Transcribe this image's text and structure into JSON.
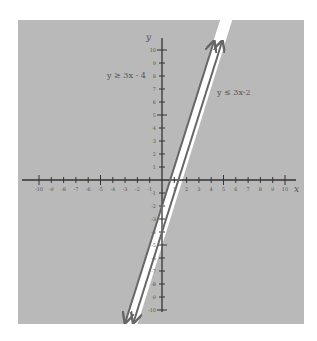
{
  "chart_data": {
    "type": "line",
    "title": "",
    "xlabel": "x",
    "ylabel": "y",
    "xlim": [
      -10,
      10
    ],
    "ylim": [
      -10,
      10
    ],
    "grid": false,
    "x_ticks": [
      -10,
      -9,
      -8,
      -7,
      -6,
      -5,
      -4,
      -3,
      -2,
      -1,
      1,
      2,
      3,
      4,
      5,
      6,
      7,
      8,
      9,
      10
    ],
    "y_ticks": [
      -10,
      -9,
      -8,
      -7,
      -6,
      -5,
      -4,
      -3,
      -2,
      -1,
      1,
      2,
      3,
      4,
      5,
      6,
      7,
      8,
      9,
      10
    ],
    "series": [
      {
        "name": "y ≥ 3x - 4 boundary",
        "equation": "y = 3x - 4",
        "style": "solid",
        "shade": "above"
      },
      {
        "name": "y ≤ 3x-2 boundary",
        "equation": "y = 3x - 2",
        "style": "solid",
        "shade": "below"
      }
    ],
    "annotations": [
      {
        "text": "y ≥ 3x - 4",
        "position": "upper-left"
      },
      {
        "text": "y ≤ 3x-2",
        "position": "right"
      }
    ],
    "shading": {
      "shaded_color": "#b9b9b9",
      "unshaded_region": "between lines",
      "unshaded_color": "#ffffff"
    }
  },
  "labels": {
    "x_axis": "x",
    "y_axis": "y",
    "ineq_left": "y ≥ 3x - 4",
    "ineq_right": "y ≤ 3x-2"
  }
}
